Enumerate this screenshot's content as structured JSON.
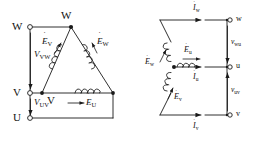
{
  "figure": {
    "line_color": "#1a1a1a",
    "background": "#ffffff"
  },
  "delta": {
    "name": "delta-connection",
    "terminals": [
      {
        "id": "W",
        "label": "W",
        "x": 18,
        "y": 27
      },
      {
        "id": "V",
        "label": "V",
        "x": 18,
        "y": 93
      },
      {
        "id": "U",
        "label": "U",
        "x": 18,
        "y": 118
      }
    ],
    "vertex_labels": [
      {
        "id": "W",
        "label": "W",
        "x": 61,
        "y": 12
      },
      {
        "id": "V",
        "label": "V",
        "x": 47,
        "y": 100
      }
    ],
    "voltages": [
      {
        "id": "V_VW",
        "base": "V",
        "sub": "VW",
        "x": 22,
        "y": 53
      },
      {
        "id": "V_UV",
        "base": "V",
        "sub": "UV",
        "x": 22,
        "y": 101
      }
    ],
    "emfs": [
      {
        "id": "E_V",
        "base": "E",
        "sub": "V",
        "x": 44,
        "y": 43
      },
      {
        "id": "E_W",
        "base": "E",
        "sub": "W",
        "x": 92,
        "y": 43
      },
      {
        "id": "E_U",
        "base": "E",
        "sub": "U",
        "x": 84,
        "y": 104
      }
    ]
  },
  "star": {
    "name": "star-connection",
    "terminals": [
      {
        "id": "w",
        "label": "w",
        "x": 243,
        "y": 20
      },
      {
        "id": "u",
        "label": "u",
        "x": 243,
        "y": 67
      },
      {
        "id": "v",
        "label": "v",
        "x": 243,
        "y": 115
      }
    ],
    "currents": [
      {
        "id": "I_w",
        "base": "I",
        "sub": "w",
        "x": 206,
        "y": 6
      },
      {
        "id": "I_u",
        "base": "I",
        "sub": "u",
        "x": 206,
        "y": 77
      },
      {
        "id": "I_v",
        "base": "I",
        "sub": "v",
        "x": 206,
        "y": 124
      }
    ],
    "voltages": [
      {
        "id": "v_wu",
        "base": "v",
        "sub": "wu",
        "x": 231,
        "y": 40
      },
      {
        "id": "v_uv",
        "base": "v",
        "sub": "uv",
        "x": 231,
        "y": 88
      }
    ],
    "emfs": [
      {
        "id": "E_w",
        "base": "E",
        "sub": "w",
        "x": 151,
        "y": 59
      },
      {
        "id": "E_u",
        "base": "E",
        "sub": "u",
        "x": 189,
        "y": 48
      },
      {
        "id": "E_v",
        "base": "E",
        "sub": "v",
        "x": 174,
        "y": 95
      }
    ]
  },
  "glyphs": {
    "emf_dot": "˙",
    "current_dot": "˙"
  }
}
